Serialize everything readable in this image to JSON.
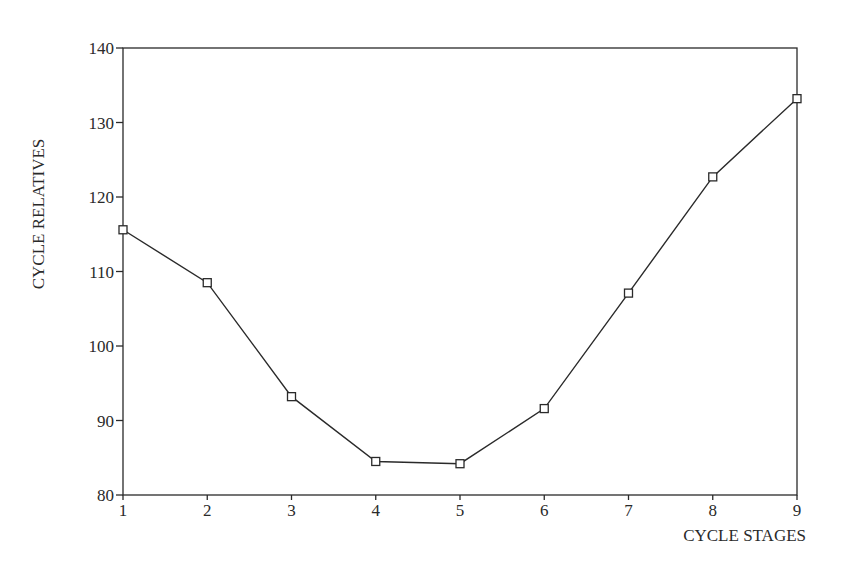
{
  "chart_data": {
    "type": "line",
    "title": "",
    "xlabel": "CYCLE STAGES",
    "ylabel": "CYCLE RELATIVES",
    "x": [
      1,
      2,
      3,
      4,
      5,
      6,
      7,
      8,
      9
    ],
    "series": [
      {
        "name": "Cycle relatives",
        "marker": "open-square",
        "values": [
          115.6,
          108.5,
          93.2,
          84.5,
          84.2,
          91.6,
          107.1,
          122.7,
          133.2
        ]
      }
    ],
    "xlim": [
      1,
      9
    ],
    "ylim": [
      80,
      140
    ],
    "xticks": [
      "1",
      "2",
      "3",
      "4",
      "5",
      "6",
      "7",
      "8",
      "9"
    ],
    "yticks": [
      "80",
      "90",
      "100",
      "110",
      "120",
      "130",
      "140"
    ],
    "grid": false,
    "legend": null
  },
  "colors": {
    "line": "#2a2a2a",
    "axis": "#2a2a2a",
    "background": "#ffffff"
  }
}
